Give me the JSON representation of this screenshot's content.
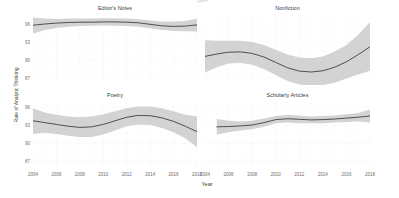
{
  "figure": {
    "y_axis_title": "Rate of Analytic Thinking",
    "x_axis_title": "Year",
    "x_ticks": [
      2004,
      2006,
      2008,
      2010,
      2012,
      2014,
      2016,
      2018
    ],
    "x_grid_years": [
      2004,
      2005,
      2006,
      2007,
      2008,
      2009,
      2010,
      2011,
      2012,
      2013,
      2014,
      2015,
      2016,
      2017,
      2018
    ],
    "y_ticks": [
      96,
      93,
      90,
      87
    ],
    "y_grid_major": [
      87,
      90,
      93,
      96
    ],
    "y_grid_minor": [
      88.5,
      91.5,
      94.5
    ],
    "colors": {
      "line": "#3f3f3f",
      "band": "#d3d3d3",
      "grid_major": "#e9e9e9",
      "grid_minor": "#f3f3f3",
      "title_text": "#3d3d3d",
      "tick_text": "#6e6e6e"
    }
  },
  "chart_data": [
    {
      "type": "line",
      "title": "Editor's Notes",
      "xlabel": "Year",
      "ylabel": "Rate of Analytic Thinking",
      "xlim": [
        2004,
        2018
      ],
      "ylim": [
        85.8,
        97.5
      ],
      "x": [
        2004,
        2005,
        2006,
        2007,
        2008,
        2009,
        2010,
        2011,
        2012,
        2013,
        2014,
        2015,
        2016,
        2017,
        2018
      ],
      "y": [
        95.8,
        96.0,
        96.15,
        96.25,
        96.3,
        96.3,
        96.35,
        96.35,
        96.3,
        96.2,
        95.95,
        95.7,
        95.6,
        95.65,
        95.85
      ],
      "band_upper": [
        97.1,
        96.9,
        96.85,
        96.9,
        96.9,
        96.9,
        96.95,
        96.95,
        96.9,
        96.8,
        96.6,
        96.4,
        96.4,
        96.5,
        96.9
      ],
      "band_lower": [
        94.4,
        95.0,
        95.35,
        95.55,
        95.65,
        95.7,
        95.75,
        95.7,
        95.65,
        95.55,
        95.3,
        95.0,
        94.85,
        94.8,
        94.75
      ]
    },
    {
      "type": "line",
      "title": "Nonfiction",
      "xlabel": "Year",
      "ylabel": "Rate of Analytic Thinking",
      "xlim": [
        2004,
        2018
      ],
      "ylim": [
        85.8,
        97.5
      ],
      "x": [
        2004,
        2005,
        2006,
        2007,
        2008,
        2009,
        2010,
        2011,
        2012,
        2013,
        2014,
        2015,
        2016,
        2017,
        2018
      ],
      "y": [
        90.6,
        91.0,
        91.3,
        91.35,
        91.1,
        90.5,
        89.6,
        88.7,
        88.15,
        88.0,
        88.2,
        88.8,
        89.7,
        90.9,
        92.2
      ],
      "band_upper": [
        93.3,
        93.2,
        93.2,
        93.2,
        93.0,
        92.5,
        91.7,
        90.9,
        90.4,
        90.3,
        90.6,
        91.4,
        92.5,
        94.2,
        96.3
      ],
      "band_lower": [
        87.9,
        88.8,
        89.4,
        89.5,
        89.2,
        88.5,
        87.5,
        86.5,
        85.9,
        85.7,
        85.8,
        86.2,
        86.9,
        87.6,
        88.2
      ]
    },
    {
      "type": "line",
      "title": "Poetry",
      "xlabel": "Year",
      "ylabel": "Rate of Analytic Thinking",
      "xlim": [
        2004,
        2018
      ],
      "ylim": [
        86.0,
        97.2
      ],
      "x": [
        2004,
        2005,
        2006,
        2007,
        2008,
        2009,
        2010,
        2011,
        2012,
        2013,
        2014,
        2015,
        2016,
        2017,
        2018
      ],
      "y": [
        93.7,
        93.4,
        93.1,
        92.8,
        92.6,
        92.7,
        93.1,
        93.7,
        94.3,
        94.6,
        94.55,
        94.2,
        93.6,
        92.8,
        91.9
      ],
      "band_upper": [
        95.8,
        95.1,
        94.7,
        94.4,
        94.3,
        94.4,
        94.8,
        95.3,
        95.8,
        96.1,
        96.1,
        95.8,
        95.3,
        94.7,
        94.4
      ],
      "band_lower": [
        91.5,
        91.7,
        91.5,
        91.2,
        91.0,
        91.0,
        91.4,
        92.1,
        92.8,
        93.1,
        93.0,
        92.5,
        91.8,
        90.8,
        89.3
      ]
    },
    {
      "type": "line",
      "title": "Scholarly Articles",
      "xlabel": "Year",
      "ylabel": "Rate of Analytic Thinking",
      "xlim": [
        2004,
        2018
      ],
      "ylim": [
        86.0,
        97.2
      ],
      "x": [
        2005,
        2006,
        2007,
        2008,
        2009,
        2010,
        2011,
        2012,
        2013,
        2014,
        2015,
        2016,
        2017,
        2018
      ],
      "y": [
        92.7,
        92.75,
        92.85,
        93.0,
        93.4,
        93.9,
        94.05,
        93.95,
        93.85,
        93.9,
        94.0,
        94.15,
        94.3,
        94.5
      ],
      "band_upper": [
        94.0,
        93.7,
        93.6,
        93.7,
        94.1,
        94.5,
        94.7,
        94.6,
        94.4,
        94.5,
        94.6,
        94.8,
        95.0,
        95.6
      ],
      "band_lower": [
        91.4,
        91.8,
        92.1,
        92.3,
        92.7,
        93.3,
        93.4,
        93.3,
        93.3,
        93.3,
        93.4,
        93.5,
        93.6,
        93.4
      ]
    }
  ]
}
